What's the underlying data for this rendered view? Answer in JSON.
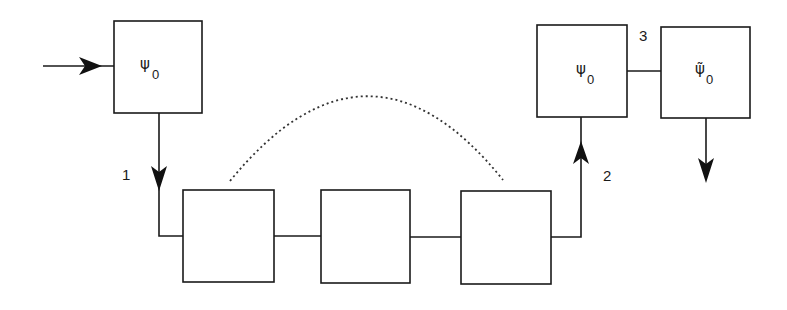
{
  "diagram": {
    "boxes": {
      "input_state": {
        "symbol": "ψ",
        "subscript": "0"
      },
      "chain_1": {
        "symbol": "",
        "subscript": ""
      },
      "chain_2": {
        "symbol": "",
        "subscript": ""
      },
      "chain_3": {
        "symbol": "",
        "subscript": ""
      },
      "output_state": {
        "symbol": "ψ",
        "subscript": "0"
      },
      "output_tilde_state": {
        "symbol": "ψ̃",
        "subscript": "0"
      }
    },
    "edge_labels": {
      "edge_1": "1",
      "edge_2": "2",
      "edge_3": "3"
    },
    "colors": {
      "stroke": "#1a1a1a",
      "background": "#ffffff"
    }
  }
}
